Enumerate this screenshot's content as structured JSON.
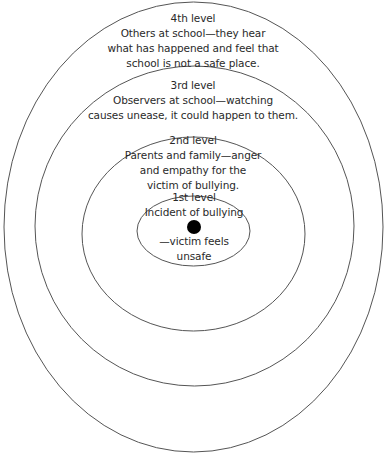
{
  "diagram": {
    "type": "concentric-ellipses",
    "stroke_color": "#555555",
    "dot_color": "#000000",
    "levels": [
      {
        "title": "1st level",
        "lines": [
          "Incident of bullying",
          "—victim feels",
          "unsafe"
        ]
      },
      {
        "title": "2nd level",
        "lines": [
          "Parents and family—anger",
          "and empathy for the",
          "victim of bullying."
        ]
      },
      {
        "title": "3rd level",
        "lines": [
          "Observers at school—watching",
          "causes unease, it could happen to them."
        ]
      },
      {
        "title": "4th level",
        "lines": [
          "Others at school—they hear",
          "what has happened and feel that",
          "school is not a safe place."
        ]
      }
    ]
  }
}
